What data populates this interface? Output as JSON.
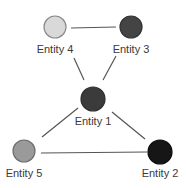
{
  "diagram": {
    "type": "network-graph",
    "nodes": [
      {
        "id": "e4",
        "label": "Entity 4",
        "cx": 55,
        "cy": 27,
        "r": 11,
        "fill": "#d9d9d9",
        "stroke": "#8a8a8a",
        "label_x": 55,
        "label_y": 53
      },
      {
        "id": "e3",
        "label": "Entity 3",
        "cx": 131,
        "cy": 27,
        "r": 11,
        "fill": "#444444",
        "stroke": "#333333",
        "label_x": 131,
        "label_y": 53
      },
      {
        "id": "e1",
        "label": "Entity 1",
        "cx": 93,
        "cy": 99,
        "r": 12,
        "fill": "#3b3b3b",
        "stroke": "#2e2e2e",
        "label_x": 93,
        "label_y": 125
      },
      {
        "id": "e5",
        "label": "Entity 5",
        "cx": 24,
        "cy": 151,
        "r": 11,
        "fill": "#9a9a9a",
        "stroke": "#6e6e6e",
        "label_x": 24,
        "label_y": 177
      },
      {
        "id": "e2",
        "label": "Entity 2",
        "cx": 160,
        "cy": 152,
        "r": 12,
        "fill": "#161616",
        "stroke": "#0c0c0c",
        "label_x": 160,
        "label_y": 177
      }
    ],
    "edges": [
      {
        "from": "e4",
        "to": "e3",
        "x1": 71,
        "y1": 28,
        "x2": 116,
        "y2": 27
      },
      {
        "from": "e4",
        "to": "e1",
        "x1": 74,
        "y1": 58,
        "x2": 84,
        "y2": 80
      },
      {
        "from": "e3",
        "to": "e1",
        "x1": 116,
        "y1": 56,
        "x2": 103,
        "y2": 80
      },
      {
        "from": "e1",
        "to": "e5",
        "x1": 78,
        "y1": 108,
        "x2": 42,
        "y2": 137
      },
      {
        "from": "e1",
        "to": "e2",
        "x1": 112,
        "y1": 112,
        "x2": 145,
        "y2": 139
      },
      {
        "from": "e5",
        "to": "e2",
        "x1": 41,
        "y1": 153,
        "x2": 147,
        "y2": 152
      }
    ],
    "edge_color": "#555555"
  }
}
